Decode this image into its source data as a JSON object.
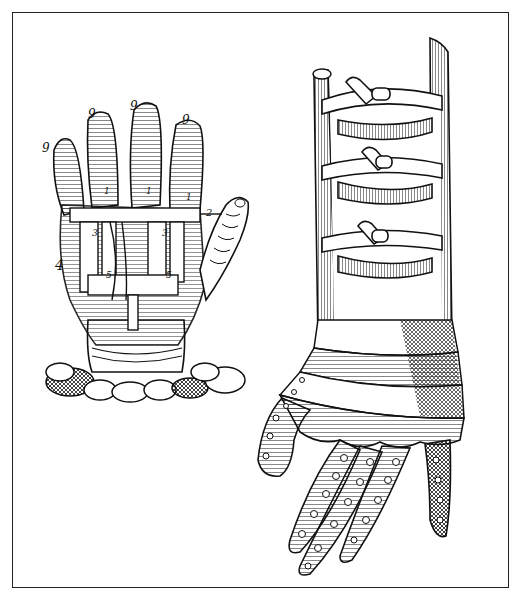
{
  "figure": {
    "left_illustration": {
      "name": "mechanical-hand",
      "labels": [
        "9",
        "9",
        "9",
        "9",
        "1",
        "1",
        "1",
        "2",
        "3",
        "3",
        "4",
        "5",
        "5"
      ]
    },
    "right_illustration": {
      "name": "armored-gauntlet-arm",
      "strap_count": 3
    },
    "colors": {
      "ink": "#111111",
      "paper": "#ffffff",
      "frame": "#222222"
    }
  }
}
